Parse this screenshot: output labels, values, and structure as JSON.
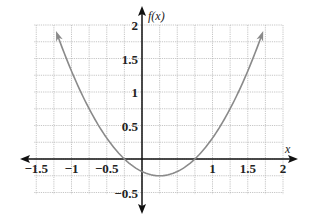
{
  "chart_data": {
    "type": "line",
    "title": "",
    "xlabel": "x",
    "ylabel": "f(x)",
    "xlim": [
      -1.5,
      2
    ],
    "ylim": [
      -0.5,
      2
    ],
    "grid": true,
    "grid_step_x": 0.25,
    "grid_step_y": 0.25,
    "x_ticks": [
      "−1.5",
      "−1",
      "−0.5",
      "1",
      "1.5",
      "2"
    ],
    "y_ticks": [
      "2",
      "1.5",
      "1",
      "0.5",
      "−0.5"
    ],
    "series": [
      {
        "name": "f(x)",
        "function": "x^2 - 0.5x - 0.1875",
        "x": [
          -1.2,
          -1.0,
          -0.75,
          -0.5,
          -0.25,
          0,
          0.25,
          0.5,
          0.75,
          1.0,
          1.25,
          1.5,
          1.7
        ],
        "values": [
          1.85,
          1.31,
          0.94,
          0.31,
          0,
          -0.19,
          -0.25,
          -0.19,
          0,
          0.31,
          0.69,
          1.31,
          1.85
        ],
        "color": "#8a8a8a",
        "arrows_at_ends": true
      }
    ],
    "vertex": [
      0.25,
      -0.25
    ],
    "roots": [
      -0.25,
      0.75
    ],
    "y_intercept": -0.1875
  },
  "labels": {
    "x_axis": "x",
    "y_axis": "f(x)"
  }
}
